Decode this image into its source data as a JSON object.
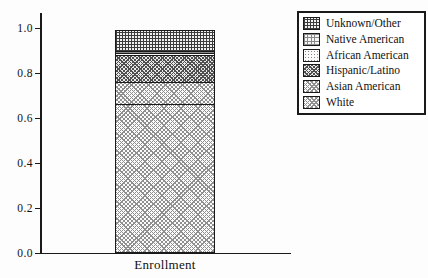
{
  "chart_data": {
    "type": "bar",
    "stacked": true,
    "categories": [
      "Enrollment"
    ],
    "xlabel": "Enrollment",
    "ylabel": "",
    "title": "",
    "ylim": [
      0.0,
      1.07
    ],
    "grid": false,
    "legend_position": "top-right-outside",
    "yticks": [
      {
        "label": "0.0",
        "value": 0.0
      },
      {
        "label": "0.2",
        "value": 0.2
      },
      {
        "label": "0.4",
        "value": 0.4
      },
      {
        "label": "0.6",
        "value": 0.6
      },
      {
        "label": "0.8",
        "value": 0.8
      },
      {
        "label": "1.0",
        "value": 1.0
      }
    ],
    "series": [
      {
        "name": "White",
        "value": 0.66,
        "pattern": "diag-light"
      },
      {
        "name": "Asian American",
        "value": 0.1,
        "pattern": "diag-light"
      },
      {
        "name": "Hispanic/Latino",
        "value": 0.12,
        "pattern": "diag-dark"
      },
      {
        "name": "African American",
        "value": 0.007,
        "pattern": "dots"
      },
      {
        "name": "Native American",
        "value": 0.007,
        "pattern": "grid-light"
      },
      {
        "name": "Unknown/Other",
        "value": 0.096,
        "pattern": "grid-dark"
      }
    ],
    "legend_order": [
      "Unknown/Other",
      "Native American",
      "African American",
      "Hispanic/Latino",
      "Asian American",
      "White"
    ],
    "colors": {
      "axis": "#1a1a1a",
      "hatch_dark": "#3c3c3c",
      "hatch_light": "#8f8f8f",
      "background": "#fdfdfd"
    }
  }
}
